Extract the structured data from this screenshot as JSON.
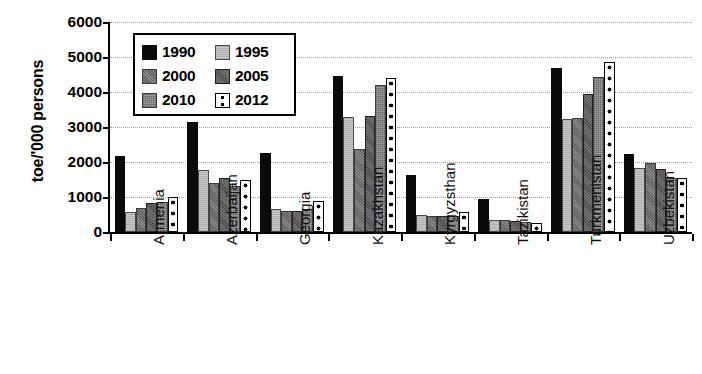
{
  "chart_data": {
    "type": "bar",
    "title": "",
    "xlabel": "",
    "ylabel": "toe/'000 persons",
    "ylim": [
      0,
      6000
    ],
    "ytick_labels": [
      "6000",
      "5000",
      "4000",
      "3000",
      "2000",
      "1000",
      "0"
    ],
    "ytick_values": [
      6000,
      5000,
      4000,
      3000,
      2000,
      1000,
      0
    ],
    "grid": true,
    "legend_position": "upper-left-inside",
    "categories": [
      "Armenia",
      "Azerbaijan",
      "Georgia",
      "Kazakhstan",
      "Kyrgyzsthan",
      "Tazikistan",
      "Turkmenistan",
      "Uzbekistan"
    ],
    "series": [
      {
        "name": "1990",
        "color": "#0a0a0a",
        "pattern": "solid-black",
        "values": [
          2180,
          3130,
          2270,
          4450,
          1640,
          950,
          4700,
          2230
        ]
      },
      {
        "name": "1995",
        "color": "#c9c9c9",
        "pattern": "light-gray",
        "values": [
          560,
          1780,
          670,
          3280,
          500,
          350,
          3220,
          1830
        ]
      },
      {
        "name": "2000",
        "color": "#8a8a8a",
        "pattern": "medium-gray-hatch",
        "values": [
          700,
          1400,
          600,
          2370,
          450,
          330,
          3250,
          1980
        ]
      },
      {
        "name": "2005",
        "color": "#4e4e4e",
        "pattern": "dark-gray-hatch",
        "values": [
          820,
          1540,
          610,
          3320,
          450,
          320,
          3950,
          1800
        ]
      },
      {
        "name": "2010",
        "color": "#a3a3a3",
        "pattern": "gray-crosshatch",
        "values": [
          850,
          1310,
          650,
          4210,
          470,
          280,
          4420,
          1530
        ]
      },
      {
        "name": "2012",
        "color": "#ffffff",
        "pattern": "white-with-black-dots",
        "values": [
          1000,
          1480,
          880,
          4400,
          560,
          260,
          4870,
          1530
        ]
      }
    ]
  },
  "legend": {
    "entries": [
      {
        "label": "1990"
      },
      {
        "label": "1995"
      },
      {
        "label": "2000"
      },
      {
        "label": "2005"
      },
      {
        "label": "2010"
      },
      {
        "label": "2012"
      }
    ]
  }
}
